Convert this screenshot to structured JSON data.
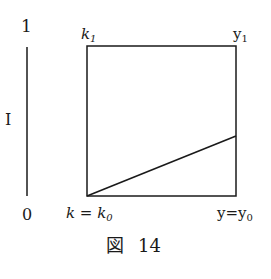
{
  "figure": {
    "caption_glyph": "図",
    "caption_number": "14",
    "left_axis": {
      "top_label": "1",
      "mid_label": "I",
      "bottom_label": "0"
    },
    "box": {
      "top_left_label_base": "k",
      "top_left_label_sub": "1",
      "top_right_label_base": "y",
      "top_right_label_sub": "1",
      "bottom_left_label_base": "k = k",
      "bottom_left_label_sub": "0",
      "bottom_right_label_base": "y=y",
      "bottom_right_label_sub": "0"
    },
    "geometry": {
      "box_x0": 87,
      "box_y0": 46,
      "box_x1": 236,
      "box_y1": 196,
      "axis_x": 27,
      "axis_y0": 47,
      "axis_y1": 196,
      "diag_from": [
        87,
        196
      ],
      "diag_to": [
        236,
        136
      ]
    }
  }
}
